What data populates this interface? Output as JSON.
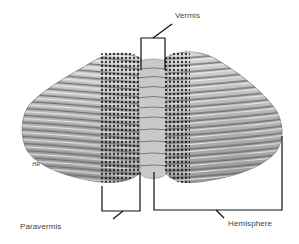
{
  "figure": {
    "colors": {
      "tissue_light": "#e4e4e4",
      "tissue_mid": "#a8a8a8",
      "tissue_dark": "#555555",
      "stipple_dot": "#1a1a1a",
      "line": "#111111",
      "label_text": "#444444"
    }
  },
  "labels": {
    "vermis": "Vermis",
    "paravermis": "Paravermis",
    "hemisphere": "Hemisphere"
  },
  "signature": "HR"
}
